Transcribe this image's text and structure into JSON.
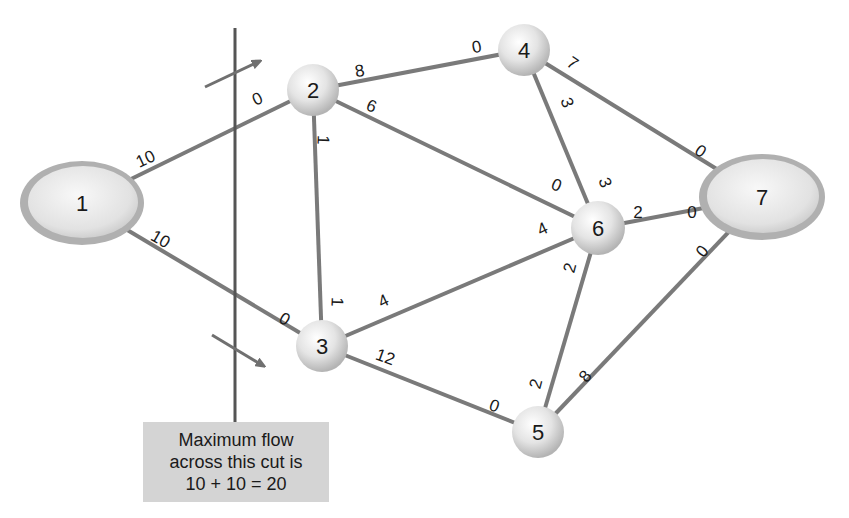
{
  "colors": {
    "edge": "#7a7a7a",
    "node_fill": "#e6e6e6",
    "node_rim": "#a8a8a8",
    "cut_line": "#555555",
    "arrow": "#707070",
    "box_bg": "#d4d4d4",
    "text": "#1a1a1a"
  },
  "nodes": [
    {
      "id": "1",
      "label": "1",
      "shape": "ellipse",
      "cx": 82,
      "cy": 203,
      "rx": 62,
      "ry": 42
    },
    {
      "id": "2",
      "label": "2",
      "shape": "circle",
      "cx": 313,
      "cy": 90,
      "r": 26
    },
    {
      "id": "3",
      "label": "3",
      "shape": "circle",
      "cx": 322,
      "cy": 346,
      "r": 26
    },
    {
      "id": "4",
      "label": "4",
      "shape": "circle",
      "cx": 524,
      "cy": 50,
      "r": 26
    },
    {
      "id": "5",
      "label": "5",
      "shape": "circle",
      "cx": 538,
      "cy": 432,
      "r": 26
    },
    {
      "id": "6",
      "label": "6",
      "shape": "circle",
      "cx": 598,
      "cy": 228,
      "r": 27
    },
    {
      "id": "7",
      "label": "7",
      "shape": "ellipse",
      "cx": 762,
      "cy": 197,
      "rx": 63,
      "ry": 43
    }
  ],
  "edges": [
    {
      "from": "1",
      "to": "2",
      "cap_from": "10",
      "cap_to": "0"
    },
    {
      "from": "1",
      "to": "3",
      "cap_from": "10",
      "cap_to": "0"
    },
    {
      "from": "2",
      "to": "4",
      "cap_from": "8",
      "cap_to": "0"
    },
    {
      "from": "2",
      "to": "6",
      "cap_from": "6",
      "cap_to": "0"
    },
    {
      "from": "2",
      "to": "3",
      "cap_from": "1",
      "cap_to": "1"
    },
    {
      "from": "3",
      "to": "6",
      "cap_from": "4",
      "cap_to": "4"
    },
    {
      "from": "3",
      "to": "5",
      "cap_from": "12",
      "cap_to": "0"
    },
    {
      "from": "4",
      "to": "6",
      "cap_from": "3",
      "cap_to": "3"
    },
    {
      "from": "4",
      "to": "7",
      "cap_from": "7",
      "cap_to": "0"
    },
    {
      "from": "6",
      "to": "7",
      "cap_from": "2",
      "cap_to": "0"
    },
    {
      "from": "6",
      "to": "5",
      "cap_from": "2",
      "cap_to": "2"
    },
    {
      "from": "5",
      "to": "7",
      "cap_from": "8",
      "cap_to": "0"
    }
  ],
  "edge_labels": [
    {
      "text": "10",
      "x": 146,
      "y": 160,
      "rot": -25
    },
    {
      "text": "0",
      "x": 258,
      "y": 100,
      "rot": -25
    },
    {
      "text": "10",
      "x": 160,
      "y": 240,
      "rot": 30
    },
    {
      "text": "0",
      "x": 284,
      "y": 320,
      "rot": 30
    },
    {
      "text": "8",
      "x": 360,
      "y": 72,
      "rot": -10
    },
    {
      "text": "0",
      "x": 477,
      "y": 48,
      "rot": -10
    },
    {
      "text": "6",
      "x": 371,
      "y": 107,
      "rot": 22
    },
    {
      "text": "0",
      "x": 556,
      "y": 186,
      "rot": 22
    },
    {
      "text": "1",
      "x": 322,
      "y": 140,
      "rot": 92
    },
    {
      "text": "1",
      "x": 336,
      "y": 302,
      "rot": 92
    },
    {
      "text": "4",
      "x": 384,
      "y": 302,
      "rot": -25
    },
    {
      "text": "4",
      "x": 543,
      "y": 230,
      "rot": -25
    },
    {
      "text": "12",
      "x": 385,
      "y": 358,
      "rot": 20
    },
    {
      "text": "0",
      "x": 494,
      "y": 407,
      "rot": 20
    },
    {
      "text": "3",
      "x": 566,
      "y": 103,
      "rot": 70
    },
    {
      "text": "3",
      "x": 604,
      "y": 183,
      "rot": 70
    },
    {
      "text": "7",
      "x": 572,
      "y": 64,
      "rot": 35
    },
    {
      "text": "0",
      "x": 700,
      "y": 152,
      "rot": 35
    },
    {
      "text": "2",
      "x": 638,
      "y": 214,
      "rot": 0
    },
    {
      "text": "0",
      "x": 692,
      "y": 214,
      "rot": 0
    },
    {
      "text": "2",
      "x": 571,
      "y": 268,
      "rot": -75
    },
    {
      "text": "2",
      "x": 537,
      "y": 384,
      "rot": -75
    },
    {
      "text": "0",
      "x": 703,
      "y": 252,
      "rot": -50
    },
    {
      "text": "8",
      "x": 586,
      "y": 377,
      "rot": -50
    }
  ],
  "cut": {
    "line": {
      "x": 235,
      "y1": 28,
      "y2": 422
    },
    "arrows": [
      {
        "x1": 205,
        "y1": 87,
        "x2": 258,
        "y2": 62
      },
      {
        "x1": 212,
        "y1": 335,
        "x2": 262,
        "y2": 365
      }
    ],
    "caption_lines": [
      "Maximum flow",
      "across this cut is",
      "10 + 10 = 20"
    ]
  }
}
